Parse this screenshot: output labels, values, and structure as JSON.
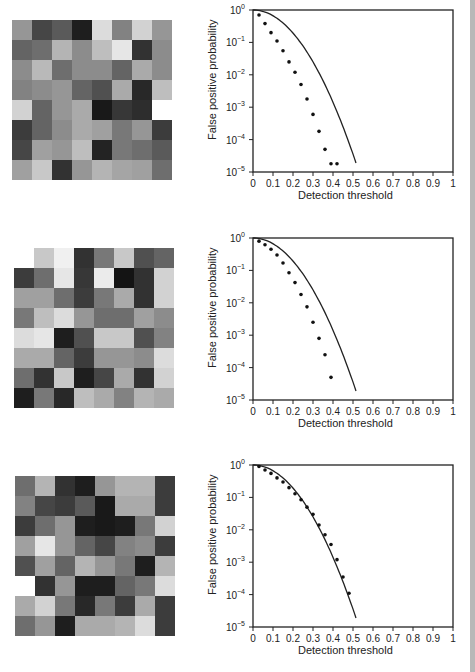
{
  "grids": [
    {
      "rows": [
        [
          150,
          70,
          90,
          30,
          220,
          130,
          210,
          150
        ],
        [
          100,
          110,
          180,
          140,
          190,
          230,
          50,
          140
        ],
        [
          140,
          185,
          110,
          140,
          140,
          100,
          170,
          140
        ],
        [
          130,
          140,
          150,
          100,
          80,
          170,
          40,
          190
        ],
        [
          210,
          100,
          150,
          170,
          25,
          55,
          45,
          255
        ],
        [
          60,
          100,
          140,
          170,
          160,
          120,
          150,
          60
        ],
        [
          70,
          160,
          150,
          190,
          35,
          120,
          110,
          90
        ],
        [
          160,
          200,
          50,
          150,
          180,
          165,
          160,
          110
        ]
      ]
    },
    {
      "rows": [
        [
          255,
          200,
          240,
          50,
          120,
          200,
          80,
          100
        ],
        [
          60,
          110,
          230,
          55,
          235,
          20,
          50,
          210
        ],
        [
          160,
          160,
          110,
          60,
          120,
          170,
          50,
          210
        ],
        [
          120,
          190,
          220,
          150,
          110,
          110,
          160,
          140
        ],
        [
          220,
          230,
          30,
          80,
          200,
          200,
          80,
          130
        ],
        [
          170,
          170,
          100,
          60,
          150,
          150,
          140,
          220
        ],
        [
          110,
          50,
          200,
          30,
          70,
          170,
          50,
          210
        ],
        [
          30,
          120,
          40,
          190,
          170,
          130,
          180,
          170
        ]
      ]
    },
    {
      "rows": [
        [
          110,
          180,
          50,
          30,
          150,
          180,
          180,
          60
        ],
        [
          130,
          70,
          60,
          90,
          25,
          170,
          170,
          60
        ],
        [
          60,
          110,
          150,
          30,
          25,
          30,
          120,
          210
        ],
        [
          160,
          230,
          150,
          100,
          70,
          130,
          140,
          60
        ],
        [
          80,
          160,
          100,
          180,
          150,
          120,
          30,
          180
        ],
        [
          255,
          50,
          150,
          30,
          30,
          100,
          120,
          220
        ],
        [
          170,
          210,
          120,
          40,
          120,
          60,
          170,
          60
        ],
        [
          110,
          150,
          30,
          170,
          170,
          180,
          220,
          60
        ]
      ]
    }
  ],
  "chart_data": [
    {
      "type": "scatter",
      "title": "",
      "xlabel": "Detection threshold",
      "ylabel": "False positive probability",
      "xlim": [
        0,
        1
      ],
      "ylim": [
        1e-05,
        1
      ],
      "yscale": "log",
      "xticks": [
        "0",
        "0.1",
        "0.2",
        "0.3",
        "0.4",
        "0.5",
        "0.6",
        "0.7",
        "0.8",
        "0.9",
        "1"
      ],
      "yticks": [
        "10^0",
        "10^-1",
        "10^-2",
        "10^-3",
        "10^-4",
        "10^-5"
      ],
      "series": [
        {
          "name": "predicted",
          "kind": "line",
          "x": [
            0,
            0.05,
            0.1,
            0.15,
            0.2,
            0.25,
            0.3,
            0.35,
            0.4,
            0.45,
            0.5,
            0.515
          ],
          "y": [
            1,
            0.75,
            0.42,
            0.2,
            0.08,
            0.026,
            0.0068,
            0.0014,
            0.00022,
            2.8e-05,
            2.8e-06,
            1e-05
          ]
        },
        {
          "name": "measured",
          "kind": "points",
          "x": [
            0.03,
            0.06,
            0.09,
            0.12,
            0.15,
            0.18,
            0.21,
            0.24,
            0.27,
            0.3,
            0.33,
            0.36,
            0.39,
            0.42
          ],
          "y": [
            0.7,
            0.38,
            0.2,
            0.11,
            0.055,
            0.025,
            0.012,
            0.005,
            0.0018,
            0.0006,
            0.00018,
            5e-05,
            1.8e-05,
            1.8e-05
          ]
        }
      ]
    },
    {
      "type": "scatter",
      "title": "",
      "xlabel": "Detection threshold",
      "ylabel": "False positive probability",
      "xlim": [
        0,
        1
      ],
      "ylim": [
        1e-05,
        1
      ],
      "yscale": "log",
      "xticks": [
        "0",
        "0.1",
        "0.2",
        "0.3",
        "0.4",
        "0.5",
        "0.6",
        "0.7",
        "0.8",
        "0.9",
        "1"
      ],
      "yticks": [
        "10^0",
        "10^-1",
        "10^-2",
        "10^-3",
        "10^-4",
        "10^-5"
      ],
      "series": [
        {
          "name": "predicted",
          "kind": "line",
          "x": [
            0,
            0.05,
            0.1,
            0.15,
            0.2,
            0.25,
            0.3,
            0.35,
            0.4,
            0.45,
            0.5,
            0.515
          ],
          "y": [
            1,
            0.75,
            0.42,
            0.2,
            0.08,
            0.026,
            0.0068,
            0.0014,
            0.00022,
            2.8e-05,
            2.8e-06,
            1e-05
          ]
        },
        {
          "name": "measured",
          "kind": "points",
          "x": [
            0.03,
            0.06,
            0.09,
            0.12,
            0.15,
            0.18,
            0.21,
            0.24,
            0.27,
            0.3,
            0.33,
            0.36,
            0.39
          ],
          "y": [
            0.8,
            0.62,
            0.45,
            0.3,
            0.17,
            0.085,
            0.042,
            0.018,
            0.0075,
            0.0025,
            0.0008,
            0.00025,
            5e-05
          ]
        }
      ]
    },
    {
      "type": "scatter",
      "title": "",
      "xlabel": "Detection threshold",
      "ylabel": "False positive probability",
      "xlim": [
        0,
        1
      ],
      "ylim": [
        1e-05,
        1
      ],
      "yscale": "log",
      "xticks": [
        "0",
        "0.1",
        "0.2",
        "0.3",
        "0.4",
        "0.5",
        "0.6",
        "0.7",
        "0.8",
        "0.9",
        "1"
      ],
      "yticks": [
        "10^0",
        "10^-1",
        "10^-2",
        "10^-3",
        "10^-4",
        "10^-5"
      ],
      "series": [
        {
          "name": "predicted",
          "kind": "line",
          "x": [
            0,
            0.05,
            0.1,
            0.15,
            0.2,
            0.25,
            0.3,
            0.35,
            0.4,
            0.45,
            0.5,
            0.515
          ],
          "y": [
            1,
            0.75,
            0.42,
            0.2,
            0.08,
            0.026,
            0.0068,
            0.0014,
            0.00022,
            2.8e-05,
            2.8e-06,
            1e-05
          ]
        },
        {
          "name": "measured",
          "kind": "points",
          "x": [
            0.03,
            0.06,
            0.09,
            0.12,
            0.15,
            0.18,
            0.21,
            0.24,
            0.27,
            0.3,
            0.33,
            0.36,
            0.39,
            0.42,
            0.45,
            0.48
          ],
          "y": [
            0.9,
            0.7,
            0.55,
            0.4,
            0.3,
            0.2,
            0.13,
            0.085,
            0.05,
            0.03,
            0.014,
            0.007,
            0.0035,
            0.0012,
            0.00035,
            0.00011
          ]
        }
      ]
    }
  ],
  "colors": {
    "axis": "#222222",
    "line": "#222222",
    "points": "#111111",
    "edge_bar": "#b8b8b8"
  }
}
